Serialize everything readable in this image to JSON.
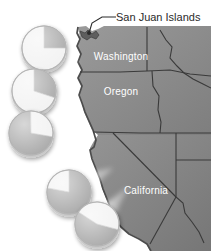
{
  "figure": {
    "kind": "thematic-map-with-pie-callouts",
    "background_color": "#ffffff",
    "region": "US Pacific Coast"
  },
  "annotation": {
    "label": "San Juan Islands",
    "leader_line_color": "#2b2b2b",
    "marker": "san-juan-islands-marker"
  },
  "map": {
    "land_fill": "#8e8e8e",
    "land_fill_dark": "#787878",
    "border_color": "#3a3a3a",
    "coast_color": "#4a4a4a",
    "state_labels": [
      {
        "name": "Washington",
        "x": 121,
        "y": 59
      },
      {
        "name": "Oregon",
        "x": 121,
        "y": 94
      },
      {
        "name": "California",
        "x": 146,
        "y": 193
      }
    ]
  },
  "chart_data": {
    "type": "pie",
    "series_note": "Five pie callouts along the Pacific coast, each two-category",
    "categories": [
      "Dark share",
      "Light share"
    ],
    "colors": {
      "dark": "#a8a8a8",
      "light": "#f2f2f2",
      "edge": "#bdbdbd"
    },
    "legend": "none",
    "pies": [
      {
        "id": "pie-1",
        "name": "coast-site-1",
        "cx": 44,
        "cy": 48,
        "r": 22,
        "values": [
          25,
          75
        ],
        "start_angle_deg": 0,
        "beam_target": {
          "x": 79,
          "y": 63
        }
      },
      {
        "id": "pie-2",
        "name": "coast-site-2",
        "cx": 34,
        "cy": 91,
        "r": 22,
        "values": [
          30,
          70
        ],
        "start_angle_deg": 0,
        "beam_target": {
          "x": 80,
          "y": 97
        }
      },
      {
        "id": "pie-3",
        "name": "coast-site-3",
        "cx": 31,
        "cy": 133,
        "r": 22,
        "values": [
          72,
          28
        ],
        "start_angle_deg": 100,
        "beam_target": {
          "x": 87,
          "y": 128
        }
      },
      {
        "id": "pie-4",
        "name": "coast-site-4",
        "cx": 69,
        "cy": 192,
        "r": 22,
        "values": [
          78,
          22
        ],
        "start_angle_deg": 0,
        "beam_target": {
          "x": 113,
          "y": 168
        }
      },
      {
        "id": "pie-5",
        "name": "coast-site-5",
        "cx": 97,
        "cy": 224,
        "r": 22,
        "values": [
          55,
          45
        ],
        "start_angle_deg": 105,
        "beam_target": {
          "x": 128,
          "y": 187
        }
      }
    ]
  }
}
